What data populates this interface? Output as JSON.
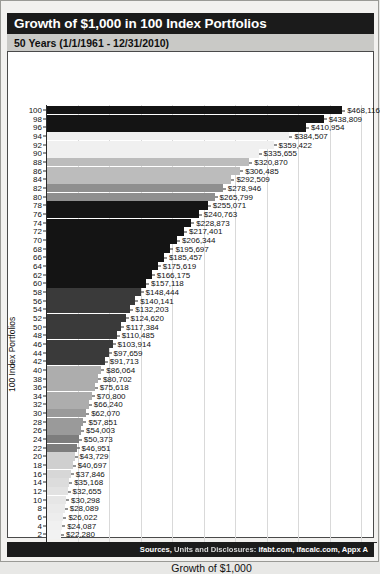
{
  "header": {
    "title": "Growth of $1,000 in 100 Index Portfolios",
    "subtitle": "50 Years (1/1/1961 - 12/31/2010)"
  },
  "footer": {
    "sources": "Sources, Units and Disclosures: ifabt.com, ifacalc.com, Appx A"
  },
  "chart_data": {
    "type": "bar",
    "orientation": "horizontal",
    "title": "Growth of $1,000 in 100 Index Portfolios",
    "subtitle": "50 Years (1/1/1961 - 12/31/2010)",
    "xlabel": "Growth of $1,000",
    "ylabel": "100 Index Portfolios",
    "xlim": [
      0,
      525000
    ],
    "ylim": [
      0,
      101
    ],
    "grid": "vertical",
    "legend": "none",
    "xticks": [
      "$0",
      "$50k",
      "$100k",
      "$150k",
      "$200k",
      "$250k",
      "$300k",
      "$350k",
      "$400k",
      "$450k",
      "$500k"
    ],
    "xtick_values": [
      0,
      50000,
      100000,
      150000,
      200000,
      250000,
      300000,
      350000,
      400000,
      450000,
      500000
    ],
    "xtick_note": "The $450k tick label is rendered smudged/illegible in the source image",
    "categories": [
      100,
      98,
      96,
      94,
      92,
      90,
      88,
      86,
      84,
      82,
      80,
      78,
      76,
      74,
      72,
      70,
      68,
      66,
      64,
      62,
      60,
      58,
      56,
      54,
      52,
      50,
      48,
      46,
      44,
      42,
      40,
      38,
      36,
      34,
      32,
      30,
      28,
      26,
      24,
      22,
      20,
      18,
      16,
      14,
      12,
      10,
      8,
      6,
      4,
      2
    ],
    "values": [
      468116,
      438809,
      410954,
      384507,
      359422,
      335655,
      320870,
      306485,
      292509,
      278946,
      265799,
      255071,
      240763,
      228873,
      217401,
      206344,
      195697,
      185457,
      175619,
      166175,
      157118,
      148444,
      140141,
      132203,
      124620,
      117384,
      110485,
      103914,
      97659,
      91713,
      86064,
      80702,
      75618,
      70800,
      66240,
      62070,
      57851,
      54003,
      50373,
      46951,
      43729,
      40697,
      37846,
      35168,
      32655,
      30298,
      28089,
      26022,
      24087,
      22280
    ],
    "labels": [
      "$468,116",
      "$438,809",
      "$410,954",
      "$384,507",
      "$359,422",
      "$335,655",
      "$320,870",
      "$306,485",
      "$292,509",
      "$278,946",
      "$265,799",
      "$255,071",
      "$240,763",
      "$228,873",
      "$217,401",
      "$206,344",
      "$195,697",
      "$185,457",
      "$175,619",
      "$166,175",
      "$157,118",
      "$148,444",
      "$140,141",
      "$132,203",
      "$124,620",
      "$117,384",
      "$110,485",
      "$103,914",
      "$97,659",
      "$91,713",
      "$86,064",
      "$80,702",
      "$75,618",
      "$70,800",
      "$66,240",
      "$62,070",
      "$57,851",
      "$54,003",
      "$50,373",
      "$46,951",
      "$43,729",
      "$40,697",
      "$37,846",
      "$35,168",
      "$32,655",
      "$30,298",
      "$28,089",
      "$26,022",
      "$24,087",
      "$22,280"
    ],
    "bar_colors": [
      "#141414",
      "#141414",
      "#141414",
      "#f0f0f0",
      "#f0f0f0",
      "#f0f0f0",
      "#bcbcbc",
      "#bcbcbc",
      "#bcbcbc",
      "#8f8f8f",
      "#8f8f8f",
      "#141414",
      "#141414",
      "#141414",
      "#141414",
      "#141414",
      "#141414",
      "#141414",
      "#141414",
      "#141414",
      "#141414",
      "#3a3a3a",
      "#3a3a3a",
      "#3a3a3a",
      "#3a3a3a",
      "#3a3a3a",
      "#3a3a3a",
      "#3a3a3a",
      "#3a3a3a",
      "#3a3a3a",
      "#adadad",
      "#adadad",
      "#adadad",
      "#adadad",
      "#adadad",
      "#9a9a9a",
      "#9a9a9a",
      "#9a9a9a",
      "#7d7d7d",
      "#7d7d7d",
      "#cfcfcf",
      "#cfcfcf",
      "#d7d7d7",
      "#dcdcdc",
      "#e2e2e2",
      "#e6e6e6",
      "#eaeaea",
      "#ededed",
      "#f0f0f0",
      "#f2f2f2"
    ]
  }
}
